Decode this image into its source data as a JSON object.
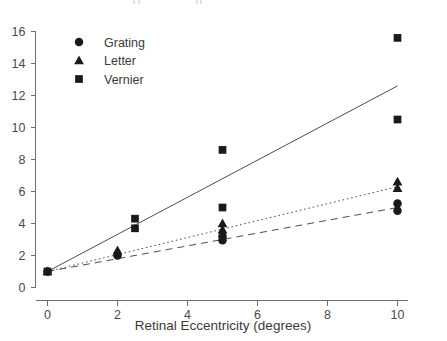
{
  "chart_data": {
    "type": "scatter",
    "title": "",
    "xlabel": "Retinal Eccentricity (degrees)",
    "ylabel": "",
    "xlim": [
      -0.55,
      11.0
    ],
    "ylim": [
      -0.9,
      16.8
    ],
    "xticks": [
      0,
      2,
      4,
      6,
      8,
      10
    ],
    "yticks": [
      0,
      2,
      4,
      6,
      8,
      10,
      12,
      14,
      16
    ],
    "xticklabels": [
      "0",
      "2",
      "4",
      "6",
      "8",
      "10"
    ],
    "yticklabels": [
      "0",
      "2",
      "4",
      "6",
      "8",
      "10",
      "12",
      "14",
      "16"
    ],
    "grid": false,
    "legend_position": "upper-left-inside",
    "legend": [
      {
        "label": "Grating",
        "marker": "circle",
        "line": "dashed"
      },
      {
        "label": "Letter",
        "marker": "triangle",
        "line": "dotted"
      },
      {
        "label": "Vernier",
        "marker": "square",
        "line": "solid"
      }
    ],
    "series": [
      {
        "name": "Grating",
        "marker": "circle",
        "line_style": "dashed",
        "color": "#1a1a1a",
        "points": [
          {
            "x": 0.0,
            "y": 1.0
          },
          {
            "x": 2.0,
            "y": 2.0
          },
          {
            "x": 5.0,
            "y": 3.2
          },
          {
            "x": 5.0,
            "y": 2.95
          },
          {
            "x": 10.0,
            "y": 5.25
          },
          {
            "x": 10.0,
            "y": 4.8
          }
        ],
        "fit_line": {
          "x0": 0.0,
          "y0": 1.0,
          "x1": 10.0,
          "y1": 5.0
        }
      },
      {
        "name": "Letter",
        "marker": "triangle",
        "line_style": "dotted",
        "color": "#1a1a1a",
        "points": [
          {
            "x": 0.0,
            "y": 1.0
          },
          {
            "x": 2.0,
            "y": 2.3
          },
          {
            "x": 5.0,
            "y": 4.0
          },
          {
            "x": 5.0,
            "y": 3.6
          },
          {
            "x": 10.0,
            "y": 6.6
          },
          {
            "x": 10.0,
            "y": 6.2
          }
        ],
        "fit_line": {
          "x0": 0.0,
          "y0": 1.0,
          "x1": 10.0,
          "y1": 6.3
        }
      },
      {
        "name": "Vernier",
        "marker": "square",
        "line_style": "solid",
        "color": "#1a1a1a",
        "points": [
          {
            "x": 0.0,
            "y": 1.0
          },
          {
            "x": 2.5,
            "y": 4.3
          },
          {
            "x": 2.5,
            "y": 3.7
          },
          {
            "x": 5.0,
            "y": 8.6
          },
          {
            "x": 5.0,
            "y": 5.0
          },
          {
            "x": 10.0,
            "y": 15.6
          },
          {
            "x": 10.0,
            "y": 10.5
          }
        ],
        "fit_line": {
          "x0": 0.0,
          "y0": 1.0,
          "x1": 10.0,
          "y1": 12.6
        }
      }
    ]
  },
  "axes": {
    "x_title": "Retinal Eccentricity (degrees)"
  },
  "legend_items": {
    "grating": "Grating",
    "letter": "Letter",
    "vernier": "Vernier"
  },
  "ticks": {
    "x": [
      "0",
      "2",
      "4",
      "6",
      "8",
      "10"
    ],
    "y": [
      "0",
      "2",
      "4",
      "6",
      "8",
      "10",
      "12",
      "14",
      "16"
    ]
  },
  "colors": {
    "marker": "#1a1a1a",
    "axis": "#6e6e6e",
    "text": "#3a3a3a"
  }
}
